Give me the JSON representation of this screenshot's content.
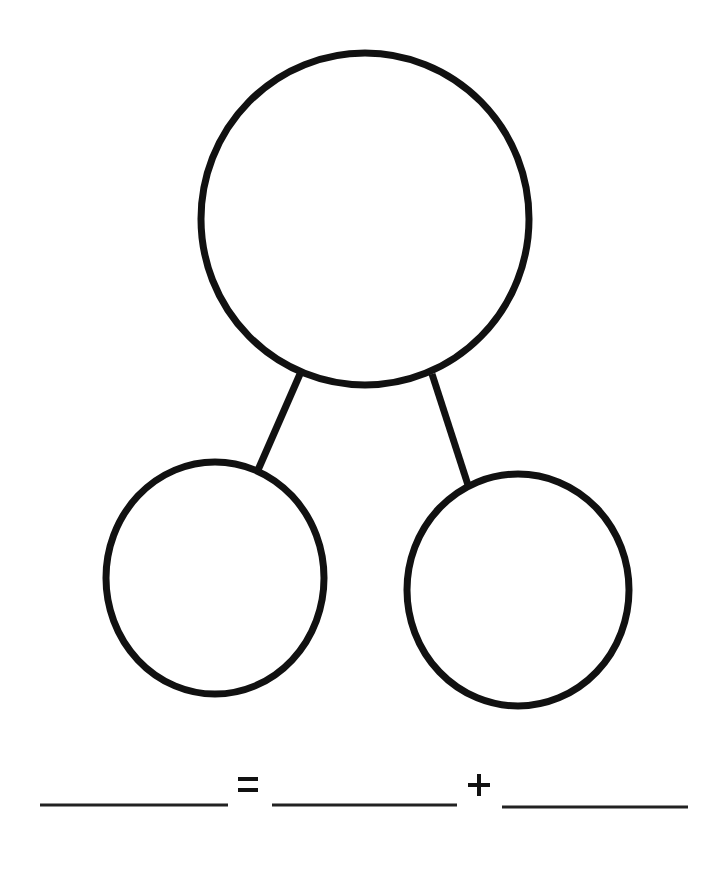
{
  "diagram": {
    "type": "number-bond",
    "stroke_color": "#111111",
    "background": "#ffffff",
    "whole_circle": {
      "label": "whole",
      "value": ""
    },
    "part_circles": [
      {
        "label": "part-left",
        "value": ""
      },
      {
        "label": "part-right",
        "value": ""
      }
    ]
  },
  "equation": {
    "blanks": [
      "",
      "",
      ""
    ],
    "equals_symbol": "=",
    "plus_symbol": "+"
  }
}
